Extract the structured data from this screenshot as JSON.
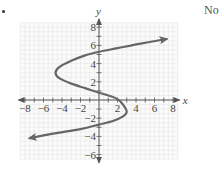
{
  "problem": {
    "answer": "No"
  },
  "chart_data": {
    "type": "line",
    "title": "",
    "xlabel": "x",
    "ylabel": "y",
    "xlim": [
      -8,
      8
    ],
    "ylim": [
      -6,
      8
    ],
    "grid": true,
    "x_ticks": [
      "-8",
      "-6",
      "-4",
      "-2",
      "2",
      "4",
      "6",
      "8"
    ],
    "y_ticks": [
      "8",
      "6",
      "4",
      "2",
      "-2",
      "-4",
      "-6"
    ],
    "series": [
      {
        "name": "curve",
        "description": "S-shaped curve (not a function of x); arrow ends at both extremes",
        "points": [
          [
            -7.5,
            -4.2
          ],
          [
            -5,
            -3.7
          ],
          [
            -2,
            -3.2
          ],
          [
            0,
            -2.7
          ],
          [
            1.5,
            -2.3
          ],
          [
            2.6,
            -1.8
          ],
          [
            3,
            -1.3
          ],
          [
            2.6,
            -0.5
          ],
          [
            2,
            0.1
          ],
          [
            1,
            0.5
          ],
          [
            0,
            0.8
          ],
          [
            -1.5,
            1.3
          ],
          [
            -3,
            1.8
          ],
          [
            -4.3,
            2.4
          ],
          [
            -4.7,
            3
          ],
          [
            -4.3,
            3.6
          ],
          [
            -3,
            4.3
          ],
          [
            -1.5,
            4.9
          ],
          [
            0,
            5.3
          ],
          [
            2,
            5.7
          ],
          [
            4.5,
            6.2
          ],
          [
            7.3,
            6.7
          ]
        ],
        "arrow_start": true,
        "arrow_end": true,
        "color": "#666666"
      }
    ],
    "legend": null
  }
}
